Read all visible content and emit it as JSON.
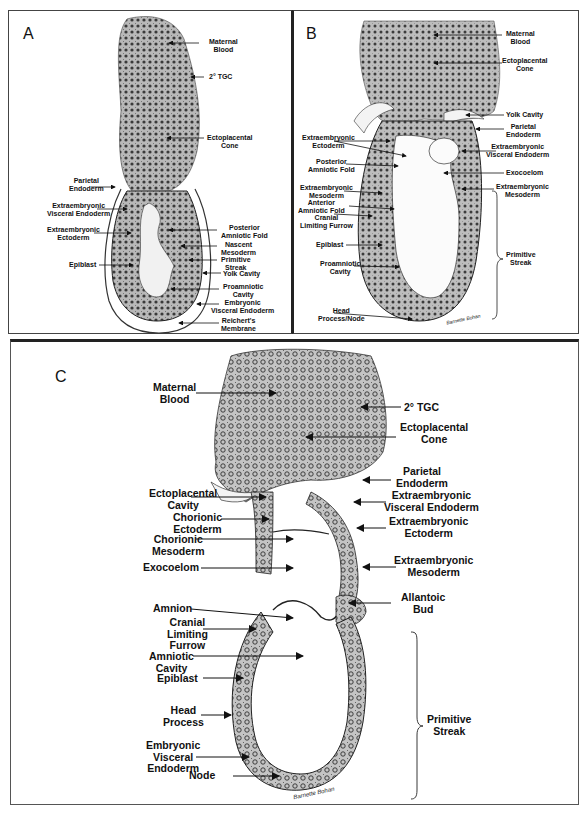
{
  "figure": {
    "panels": [
      {
        "id": "A",
        "labels": [
          {
            "text": "Maternal\nBlood"
          },
          {
            "text": "2° TGC"
          },
          {
            "text": "Ectoplacental\nCone"
          },
          {
            "text": "Parietal\nEndoderm"
          },
          {
            "text": "Extraembryonic\nVisceral Endoderm"
          },
          {
            "text": "Extraembryonic\nEctoderm"
          },
          {
            "text": "Posterior\nAmniotic Fold"
          },
          {
            "text": "Nascent\nMesoderm"
          },
          {
            "text": "Epiblast"
          },
          {
            "text": "Primitive\nStreak"
          },
          {
            "text": "Yolk Cavity"
          },
          {
            "text": "Proamniotic\nCavity"
          },
          {
            "text": "Embryonic\nVisceral Endoderm"
          },
          {
            "text": "Reichert's\nMembrane"
          }
        ]
      },
      {
        "id": "B",
        "labels": [
          {
            "text": "Maternal\nBlood"
          },
          {
            "text": "Ectoplacental\nCone"
          },
          {
            "text": "Yolk Cavity"
          },
          {
            "text": "Parietal\nEndoderm"
          },
          {
            "text": "Extraembryonic\nEctoderm"
          },
          {
            "text": "Extraembryonic\nVisceral Endoderm"
          },
          {
            "text": "Posterior\nAmniotic Fold"
          },
          {
            "text": "Exocoelom"
          },
          {
            "text": "Extraembryonic\nMesoderm"
          },
          {
            "text": "Extraembryonic\nMesoderm"
          },
          {
            "text": "Anterior\nAmniotic Fold"
          },
          {
            "text": "Cranial\nLimiting Furrow"
          },
          {
            "text": "Epiblast"
          },
          {
            "text": "Primitive\nStreak"
          },
          {
            "text": "Proamniotic\nCavity"
          },
          {
            "text": "Head\nProcess/Node"
          }
        ],
        "signature": "Barnette Bohan"
      },
      {
        "id": "C",
        "labels": [
          {
            "text": "Maternal\nBlood"
          },
          {
            "text": "2° TGC"
          },
          {
            "text": "Ectoplacental\nCone"
          },
          {
            "text": "Parietal\nEndoderm"
          },
          {
            "text": "Ectoplacental\nCavity"
          },
          {
            "text": "Extraembryonic\nVisceral Endoderm"
          },
          {
            "text": "Chorionic\nEctoderm"
          },
          {
            "text": "Extraembryonic\nEctoderm"
          },
          {
            "text": "Chorionic\nMesoderm"
          },
          {
            "text": "Exocoelom"
          },
          {
            "text": "Extraembryonic\nMesoderm"
          },
          {
            "text": "Allantoic\nBud"
          },
          {
            "text": "Amnion"
          },
          {
            "text": "Cranial\nLimiting\nFurrow"
          },
          {
            "text": "Amniotic\nCavity"
          },
          {
            "text": "Epiblast"
          },
          {
            "text": "Primitive\nStreak"
          },
          {
            "text": "Head\nProcess"
          },
          {
            "text": "Embryonic\nVisceral\nEndoderm"
          },
          {
            "text": "Node"
          }
        ],
        "signature": "Barnette Bohan"
      }
    ]
  },
  "colors": {
    "ink": "#111111",
    "tissue": "#9a9a9a",
    "tissue_dark": "#4a4a4a",
    "background": "#ffffff"
  }
}
